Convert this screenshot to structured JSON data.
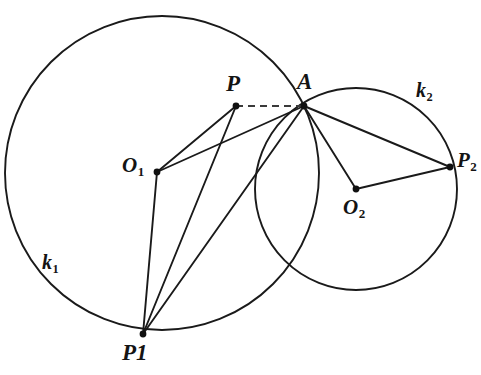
{
  "figure": {
    "background_color": "#ffffff",
    "stroke_color": "#1a1a1a",
    "width": 481,
    "height": 375
  },
  "circles": [
    {
      "name": "k1",
      "label": "k",
      "subscript": "1",
      "center_label": "O",
      "center_subscript": "1",
      "cx": 162,
      "cy": 173,
      "r": 157,
      "label_x": 42,
      "label_y": 252
    },
    {
      "name": "k2",
      "label": "k",
      "subscript": "2",
      "center_label": "O",
      "center_subscript": "2",
      "cx": 356,
      "cy": 189,
      "r": 101,
      "label_x": 416,
      "label_y": 80
    }
  ],
  "points": [
    {
      "id": "P",
      "label": "P",
      "subscript": "",
      "x": 236,
      "y": 106,
      "label_x": 226,
      "label_y": 72
    },
    {
      "id": "A",
      "label": "A",
      "subscript": "",
      "x": 304,
      "y": 106,
      "label_x": 297,
      "label_y": 70
    },
    {
      "id": "O1",
      "label": "O",
      "subscript": "1",
      "x": 157,
      "y": 172,
      "label_x": 122,
      "label_y": 155
    },
    {
      "id": "O2",
      "label": "O",
      "subscript": "2",
      "x": 356,
      "y": 189,
      "label_x": 343,
      "label_y": 197
    },
    {
      "id": "P1",
      "label": "P1",
      "subscript": "",
      "x": 143,
      "y": 334,
      "label_x": 122,
      "label_y": 341
    },
    {
      "id": "P2",
      "label": "P",
      "subscript": "2",
      "x": 450,
      "y": 167,
      "label_x": 457,
      "label_y": 150
    }
  ],
  "segments": [
    {
      "name": "O1-P",
      "from": "O1",
      "to": "P",
      "style": "solid"
    },
    {
      "name": "O1-A",
      "from": "O1",
      "to": "A",
      "style": "solid"
    },
    {
      "name": "O1-P1",
      "from": "O1",
      "to": "P1",
      "style": "solid"
    },
    {
      "name": "P-P1",
      "from": "P",
      "to": "P1",
      "style": "solid"
    },
    {
      "name": "A-P1",
      "from": "A",
      "to": "P1",
      "style": "solid"
    },
    {
      "name": "A-O2",
      "from": "A",
      "to": "O2",
      "style": "solid"
    },
    {
      "name": "A-P2",
      "from": "A",
      "to": "P2",
      "style": "solid"
    },
    {
      "name": "O2-P2",
      "from": "O2",
      "to": "P2",
      "style": "solid"
    },
    {
      "name": "P-A",
      "from": "P",
      "to": "A",
      "style": "dashed"
    }
  ]
}
